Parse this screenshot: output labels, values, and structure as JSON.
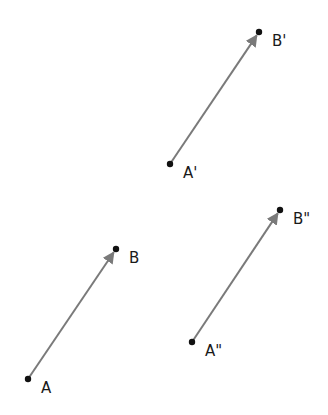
{
  "diagram": {
    "type": "vector-translation",
    "colors": {
      "vector": "#7a7a7a",
      "point": "#111111",
      "label": "#1a1a1a",
      "background": "#ffffff"
    },
    "points": [
      {
        "id": "A",
        "label": "A"
      },
      {
        "id": "B",
        "label": "B"
      },
      {
        "id": "A1",
        "label": "A'"
      },
      {
        "id": "B1",
        "label": "B'"
      },
      {
        "id": "A2",
        "label": "A\""
      },
      {
        "id": "B2",
        "label": "B\""
      }
    ],
    "vectors": [
      {
        "name": "AB",
        "from": "A",
        "to": "B"
      },
      {
        "name": "A1B1",
        "from": "A1",
        "to": "B1"
      },
      {
        "name": "A2B2",
        "from": "A2",
        "to": "B2"
      }
    ]
  }
}
